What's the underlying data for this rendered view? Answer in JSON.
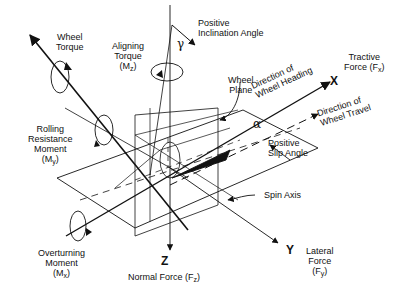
{
  "diagram": {
    "axes": [
      {
        "id": "x",
        "label": "X"
      },
      {
        "id": "y",
        "label": "Y"
      },
      {
        "id": "z",
        "label": "Z"
      }
    ],
    "labels": {
      "wheel_torque": [
        "Wheel",
        "Torque"
      ],
      "aligning_torque": [
        "Aligning",
        "Torque",
        "(M",
        "z",
        ")"
      ],
      "positive_inclination": [
        "Positive",
        "Inclination Angle"
      ],
      "tractive_force": [
        "Tractive",
        "Force (F",
        "x",
        ")"
      ],
      "wheel_plane": [
        "Wheel",
        "Plane"
      ],
      "direction_heading": [
        "Direction of",
        "Wheel Heading"
      ],
      "direction_travel": [
        "Direction of",
        "Wheel Travel"
      ],
      "rolling_resistance": [
        "Rolling",
        "Resistance",
        "Moment",
        "(M",
        "y",
        ")"
      ],
      "positive_slip": [
        "Positive",
        "Slip Angle"
      ],
      "spin_axis": "Spin Axis",
      "overturning": [
        "Overturning",
        "Moment",
        "(M",
        "x",
        ")"
      ],
      "normal_force": [
        "Normal Force (F",
        "z",
        ")"
      ],
      "lateral_force": [
        "Lateral",
        "Force",
        "(F",
        "y",
        ")"
      ],
      "gamma": "γ",
      "alpha": "α"
    },
    "colors": {
      "line": "#111111",
      "background": "#ffffff"
    }
  }
}
